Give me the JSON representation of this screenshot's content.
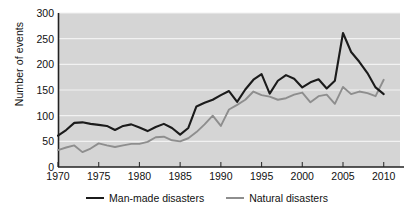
{
  "chart_data": {
    "type": "line",
    "title": "",
    "xlabel": "",
    "ylabel": "Number of events",
    "xlim": [
      1970,
      2012
    ],
    "ylim": [
      0,
      300
    ],
    "xticks": [
      1970,
      1975,
      1980,
      1985,
      1990,
      1995,
      2000,
      2005,
      2010
    ],
    "yticks": [
      0,
      50,
      100,
      150,
      200,
      250,
      300
    ],
    "grid": "horizontal",
    "legend_position": "bottom-center",
    "x": [
      1970,
      1971,
      1972,
      1973,
      1974,
      1975,
      1976,
      1977,
      1978,
      1979,
      1980,
      1981,
      1982,
      1983,
      1984,
      1985,
      1986,
      1987,
      1988,
      1989,
      1990,
      1991,
      1992,
      1993,
      1994,
      1995,
      1996,
      1997,
      1998,
      1999,
      2000,
      2001,
      2002,
      2003,
      2004,
      2005,
      2006,
      2007,
      2008,
      2009,
      2010
    ],
    "series": [
      {
        "name": "Man-made disasters",
        "color": "#1b1b1b",
        "values": [
          61,
          72,
          86,
          87,
          84,
          82,
          80,
          72,
          80,
          83,
          77,
          70,
          78,
          84,
          76,
          63,
          76,
          118,
          125,
          131,
          140,
          148,
          127,
          151,
          170,
          181,
          143,
          168,
          179,
          172,
          155,
          165,
          171,
          153,
          168,
          261,
          224,
          205,
          183,
          155,
          142
        ]
      },
      {
        "name": "Natural disasters",
        "color": "#8e8e8e",
        "values": [
          33,
          38,
          42,
          29,
          36,
          46,
          42,
          39,
          42,
          45,
          45,
          49,
          58,
          59,
          52,
          50,
          56,
          68,
          83,
          100,
          80,
          112,
          121,
          131,
          147,
          140,
          137,
          131,
          134,
          141,
          145,
          126,
          138,
          141,
          123,
          156,
          142,
          147,
          144,
          138,
          170
        ]
      }
    ]
  },
  "axis": {
    "ylabel": "Number of events",
    "ytick_labels": [
      "300",
      "250",
      "200",
      "150",
      "100",
      "50",
      "0"
    ],
    "xtick_labels": [
      "1970",
      "1975",
      "1980",
      "1985",
      "1990",
      "1995",
      "2000",
      "2005",
      "2010"
    ]
  },
  "legend": {
    "items": [
      {
        "label": "Man-made disasters",
        "color": "#1b1b1b"
      },
      {
        "label": "Natural disasters",
        "color": "#8e8e8e"
      }
    ]
  },
  "colors": {
    "plot_background": "#d5d5d5",
    "gridline": "#f2f2f2",
    "axis": "#222222",
    "page_background": "#ffffff"
  }
}
